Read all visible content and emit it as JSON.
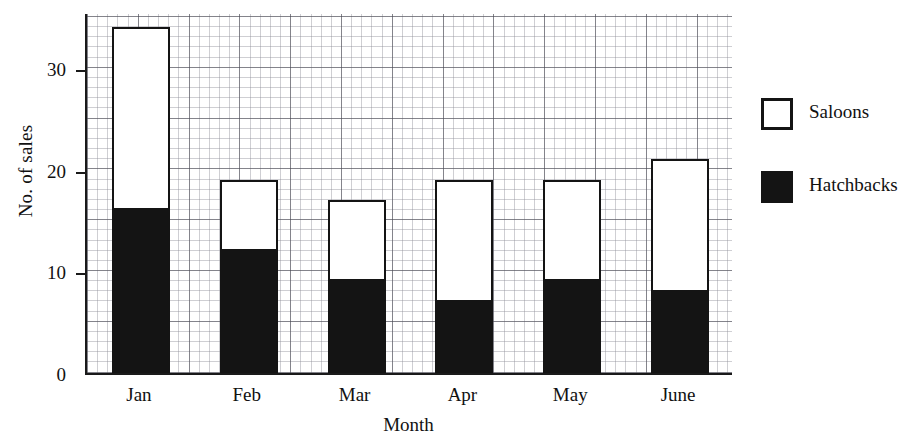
{
  "chart_data": {
    "type": "bar",
    "subtype": "stacked-vertical",
    "title": "",
    "xlabel": "Month",
    "ylabel": "No. of sales",
    "categories": [
      "Jan",
      "Feb",
      "Mar",
      "Apr",
      "May",
      "June"
    ],
    "series": [
      {
        "name": "Hatchbacks",
        "color": "#141414",
        "fill": "solid-black",
        "values": [
          16,
          12,
          9,
          7,
          9,
          8
        ]
      },
      {
        "name": "Saloons",
        "color": "#ffffff",
        "fill": "white-outlined",
        "values": [
          18,
          7,
          8,
          12,
          10,
          13
        ]
      }
    ],
    "stacked_totals": [
      34,
      19,
      17,
      19,
      19,
      21
    ],
    "ylim": [
      0,
      35.5
    ],
    "xlim_categories": 6,
    "y_ticks": [
      0,
      10,
      20,
      30
    ],
    "y_tick_labels": [
      "0",
      "10",
      "20",
      "30"
    ],
    "grid": {
      "enabled": true,
      "major_interval": 5,
      "minor_interval": 1,
      "style": "graph-paper"
    },
    "legend": {
      "position": "right",
      "entries": [
        {
          "label": "Saloons",
          "swatch": "hollow"
        },
        {
          "label": "Hatchbacks",
          "swatch": "filled"
        }
      ]
    }
  },
  "axes": {
    "y_title": "No. of sales",
    "x_title": "Month",
    "y_tick_labels": [
      "0",
      "10",
      "20",
      "30"
    ],
    "x_tick_labels": [
      "Jan",
      "Feb",
      "Mar",
      "Apr",
      "May",
      "June"
    ]
  },
  "legend": {
    "saloons_label": "Saloons",
    "hatchbacks_label": "Hatchbacks"
  }
}
